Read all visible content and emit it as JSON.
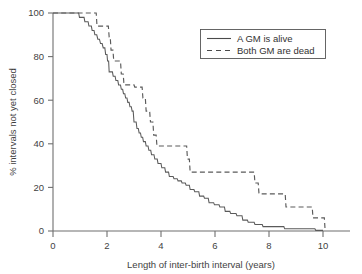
{
  "chart_data": {
    "type": "line",
    "title": "",
    "xlabel": "Length of inter-birth interval (years)",
    "ylabel": "% intervals not yet closed",
    "xlim": [
      0,
      11
    ],
    "ylim": [
      0,
      100
    ],
    "xticks": [
      0,
      2,
      4,
      6,
      8,
      10
    ],
    "xtick_labels": [
      "0",
      "2",
      "4",
      "6",
      "8",
      "10"
    ],
    "yticks": [
      0,
      20,
      40,
      60,
      80,
      100
    ],
    "ytick_labels": [
      "0",
      "20",
      "40",
      "60",
      "80",
      "100"
    ],
    "grid": false,
    "legend_position": "upper right",
    "series": [
      {
        "name": "A GM is alive",
        "style": "solid",
        "color": "#5a5a5a",
        "points": [
          [
            0.0,
            100
          ],
          [
            0.95,
            100
          ],
          [
            0.98,
            98
          ],
          [
            1.15,
            98
          ],
          [
            1.18,
            96
          ],
          [
            1.3,
            96
          ],
          [
            1.33,
            94
          ],
          [
            1.42,
            94
          ],
          [
            1.45,
            92
          ],
          [
            1.52,
            92
          ],
          [
            1.55,
            90
          ],
          [
            1.62,
            90
          ],
          [
            1.66,
            88
          ],
          [
            1.72,
            88
          ],
          [
            1.76,
            86
          ],
          [
            1.82,
            86
          ],
          [
            1.86,
            84
          ],
          [
            1.92,
            84
          ],
          [
            1.95,
            81
          ],
          [
            2.0,
            81
          ],
          [
            2.02,
            78
          ],
          [
            2.06,
            78
          ],
          [
            2.08,
            73
          ],
          [
            2.2,
            73
          ],
          [
            2.23,
            71
          ],
          [
            2.3,
            71
          ],
          [
            2.33,
            69
          ],
          [
            2.4,
            69
          ],
          [
            2.43,
            67
          ],
          [
            2.5,
            67
          ],
          [
            2.53,
            65
          ],
          [
            2.58,
            65
          ],
          [
            2.61,
            63
          ],
          [
            2.66,
            63
          ],
          [
            2.69,
            61
          ],
          [
            2.74,
            61
          ],
          [
            2.77,
            59
          ],
          [
            2.82,
            59
          ],
          [
            2.85,
            57
          ],
          [
            2.9,
            57
          ],
          [
            2.93,
            55
          ],
          [
            2.97,
            55
          ],
          [
            3.0,
            50
          ],
          [
            3.08,
            50
          ],
          [
            3.11,
            47
          ],
          [
            3.16,
            47
          ],
          [
            3.19,
            45
          ],
          [
            3.24,
            45
          ],
          [
            3.27,
            43
          ],
          [
            3.32,
            43
          ],
          [
            3.35,
            41
          ],
          [
            3.42,
            41
          ],
          [
            3.45,
            39
          ],
          [
            3.52,
            39
          ],
          [
            3.55,
            37
          ],
          [
            3.62,
            37
          ],
          [
            3.65,
            35
          ],
          [
            3.74,
            35
          ],
          [
            3.77,
            33
          ],
          [
            3.86,
            33
          ],
          [
            3.89,
            31
          ],
          [
            4.0,
            31
          ],
          [
            4.03,
            29
          ],
          [
            4.14,
            29
          ],
          [
            4.17,
            27
          ],
          [
            4.28,
            27
          ],
          [
            4.31,
            25
          ],
          [
            4.45,
            25
          ],
          [
            4.48,
            24
          ],
          [
            4.6,
            24
          ],
          [
            4.63,
            23
          ],
          [
            4.75,
            23
          ],
          [
            4.78,
            22
          ],
          [
            4.9,
            22
          ],
          [
            4.93,
            21
          ],
          [
            5.05,
            21
          ],
          [
            5.08,
            19
          ],
          [
            5.22,
            19
          ],
          [
            5.25,
            18
          ],
          [
            5.4,
            18
          ],
          [
            5.43,
            16
          ],
          [
            5.58,
            16
          ],
          [
            5.61,
            15
          ],
          [
            5.75,
            15
          ],
          [
            5.78,
            13
          ],
          [
            5.95,
            13
          ],
          [
            5.98,
            12
          ],
          [
            6.15,
            12
          ],
          [
            6.18,
            11
          ],
          [
            6.35,
            11
          ],
          [
            6.38,
            9
          ],
          [
            6.55,
            9
          ],
          [
            6.58,
            8
          ],
          [
            6.78,
            8
          ],
          [
            6.81,
            7
          ],
          [
            7.0,
            7
          ],
          [
            7.03,
            5
          ],
          [
            7.2,
            5
          ],
          [
            7.23,
            4
          ],
          [
            7.45,
            4
          ],
          [
            7.48,
            3
          ],
          [
            7.75,
            3
          ],
          [
            7.78,
            2
          ],
          [
            8.55,
            2
          ],
          [
            8.58,
            1
          ],
          [
            9.7,
            1
          ],
          [
            9.73,
            0.3
          ],
          [
            10.0,
            0.3
          ]
        ]
      },
      {
        "name": "Both GM are dead",
        "style": "dashed",
        "color": "#5a5a5a",
        "points": [
          [
            0.0,
            100
          ],
          [
            1.6,
            100
          ],
          [
            1.63,
            94
          ],
          [
            2.05,
            94
          ],
          [
            2.08,
            89
          ],
          [
            2.12,
            89
          ],
          [
            2.15,
            83
          ],
          [
            2.22,
            83
          ],
          [
            2.25,
            78
          ],
          [
            2.5,
            78
          ],
          [
            2.53,
            72
          ],
          [
            2.6,
            72
          ],
          [
            2.63,
            67
          ],
          [
            3.0,
            67
          ],
          [
            3.03,
            66
          ],
          [
            3.3,
            66
          ],
          [
            3.33,
            61
          ],
          [
            3.42,
            61
          ],
          [
            3.45,
            55
          ],
          [
            3.58,
            55
          ],
          [
            3.61,
            50
          ],
          [
            3.7,
            50
          ],
          [
            3.73,
            44
          ],
          [
            3.82,
            44
          ],
          [
            3.85,
            39
          ],
          [
            4.95,
            39
          ],
          [
            4.98,
            33
          ],
          [
            5.05,
            33
          ],
          [
            5.08,
            27
          ],
          [
            7.45,
            27
          ],
          [
            7.48,
            22
          ],
          [
            7.6,
            22
          ],
          [
            7.63,
            17
          ],
          [
            8.6,
            17
          ],
          [
            8.63,
            11
          ],
          [
            9.6,
            11
          ],
          [
            9.63,
            6
          ],
          [
            10.05,
            6
          ],
          [
            10.08,
            0
          ]
        ]
      }
    ]
  },
  "legend": {
    "entries": [
      {
        "label": "A GM is alive",
        "style": "solid"
      },
      {
        "label": "Both GM are dead",
        "style": "dashed"
      }
    ]
  }
}
